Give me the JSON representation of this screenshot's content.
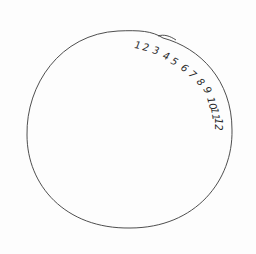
{
  "drawing": {
    "subject": "hand-drawn clock face",
    "stroke_color": "#3a3a3a",
    "background_color": "#fdfdfd",
    "clock_numbers": [
      {
        "label": "1",
        "x": 134,
        "y": 48,
        "rotate": 10
      },
      {
        "label": "2",
        "x": 142,
        "y": 50,
        "rotate": 12
      },
      {
        "label": "3",
        "x": 152,
        "y": 53,
        "rotate": 15
      },
      {
        "label": "4",
        "x": 162,
        "y": 58,
        "rotate": 22
      },
      {
        "label": "5",
        "x": 170,
        "y": 63,
        "rotate": 28
      },
      {
        "label": "6",
        "x": 180,
        "y": 69,
        "rotate": 35
      },
      {
        "label": "7",
        "x": 188,
        "y": 75,
        "rotate": 40
      },
      {
        "label": "8",
        "x": 196,
        "y": 82,
        "rotate": 48
      },
      {
        "label": "9",
        "x": 203,
        "y": 89,
        "rotate": 60
      },
      {
        "label": "10",
        "x": 207,
        "y": 98,
        "rotate": 75
      },
      {
        "label": "11",
        "x": 211,
        "y": 108,
        "rotate": 82
      },
      {
        "label": "12",
        "x": 215,
        "y": 118,
        "rotate": 90
      }
    ]
  }
}
